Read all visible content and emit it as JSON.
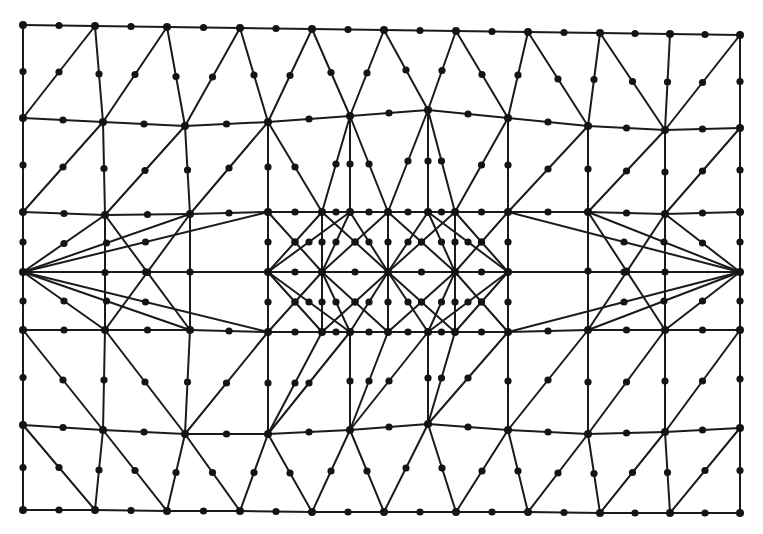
{
  "figure": {
    "kind": "finite-element-mesh",
    "width": 763,
    "height": 534,
    "background_color": "#ffffff",
    "edge_color": "#1a1a1a",
    "node_color": "#141414",
    "edge_stroke_width": 2.0,
    "corner_node_radius": 4.0,
    "midside_node_radius": 3.6,
    "element_type": "6-node quadratic triangle (T6)",
    "counts": {
      "corner_nodes": 108,
      "midside_nodes": 268,
      "edges": 268,
      "triangles": 161
    }
  },
  "chart_data": {
    "type": "scatter",
    "title": "",
    "xlabel": "",
    "ylabel": "",
    "xlim": [
      0,
      763
    ],
    "ylim": [
      0,
      534
    ],
    "grid": false,
    "legend": null,
    "corner_nodes": [
      [
        23,
        25
      ],
      [
        95,
        26
      ],
      [
        167,
        27
      ],
      [
        240,
        28
      ],
      [
        312,
        29
      ],
      [
        384,
        30
      ],
      [
        456,
        31
      ],
      [
        528,
        32
      ],
      [
        600,
        33
      ],
      [
        670,
        34
      ],
      [
        740,
        35
      ],
      [
        23,
        118
      ],
      [
        103,
        122
      ],
      [
        185,
        126
      ],
      [
        268,
        122
      ],
      [
        350,
        116
      ],
      [
        428,
        110
      ],
      [
        508,
        118
      ],
      [
        588,
        126
      ],
      [
        665,
        130
      ],
      [
        740,
        128
      ],
      [
        23,
        212
      ],
      [
        105,
        215
      ],
      [
        190,
        214
      ],
      [
        268,
        212
      ],
      [
        322,
        212
      ],
      [
        350,
        212
      ],
      [
        388,
        212
      ],
      [
        428,
        212
      ],
      [
        455,
        212
      ],
      [
        508,
        212
      ],
      [
        588,
        212
      ],
      [
        665,
        214
      ],
      [
        740,
        212
      ],
      [
        23,
        272
      ],
      [
        268,
        272
      ],
      [
        322,
        272
      ],
      [
        388,
        272
      ],
      [
        455,
        272
      ],
      [
        508,
        272
      ],
      [
        740,
        272
      ],
      [
        23,
        330
      ],
      [
        105,
        330
      ],
      [
        190,
        330
      ],
      [
        268,
        332
      ],
      [
        322,
        332
      ],
      [
        350,
        332
      ],
      [
        388,
        332
      ],
      [
        428,
        332
      ],
      [
        455,
        332
      ],
      [
        508,
        332
      ],
      [
        588,
        330
      ],
      [
        665,
        330
      ],
      [
        740,
        330
      ],
      [
        23,
        425
      ],
      [
        103,
        430
      ],
      [
        185,
        434
      ],
      [
        268,
        434
      ],
      [
        350,
        430
      ],
      [
        428,
        424
      ],
      [
        508,
        430
      ],
      [
        588,
        434
      ],
      [
        665,
        432
      ],
      [
        740,
        428
      ],
      [
        23,
        510
      ],
      [
        95,
        510
      ],
      [
        167,
        511
      ],
      [
        240,
        511
      ],
      [
        312,
        512
      ],
      [
        384,
        512
      ],
      [
        456,
        512
      ],
      [
        528,
        512
      ],
      [
        600,
        513
      ],
      [
        670,
        513
      ],
      [
        740,
        513
      ]
    ],
    "boundary": {
      "top_y_range": [
        25,
        35
      ],
      "bottom_y_range": [
        510,
        513
      ],
      "left_x": 23,
      "right_x": 740
    },
    "refined_band": {
      "x_range": [
        268,
        508
      ],
      "y_range": [
        212,
        332
      ],
      "row_ys": [
        212,
        272,
        332
      ],
      "column_xs": [
        268,
        322,
        388,
        455,
        508
      ]
    }
  }
}
